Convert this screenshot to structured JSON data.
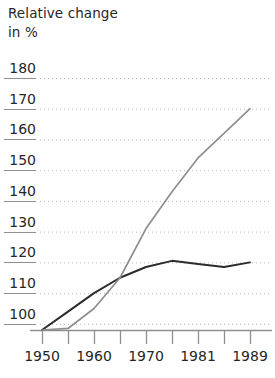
{
  "title": {
    "line1": "Relative change",
    "line2": "in %"
  },
  "colors": {
    "series_dark": "#2c2c2c",
    "series_gray": "#8e8e8e",
    "gridline": "#b9b9b9",
    "axis": "#8f8f8f",
    "text": "#262626"
  },
  "chart_data": {
    "type": "line",
    "title": "Relative change in %",
    "xlabel": "",
    "ylabel": "Relative change in %",
    "ylim": [
      95,
      182
    ],
    "xlim": [
      1950,
      1989
    ],
    "grid": true,
    "legend": "none",
    "yticks": [
      180,
      170,
      160,
      150,
      140,
      130,
      120,
      110,
      100
    ],
    "ytick_labels": [
      "180",
      "170",
      "160",
      "150",
      "140",
      "130",
      "120",
      "110",
      "100"
    ],
    "xticks": [
      1950,
      1955,
      1960,
      1965,
      1970,
      1975,
      1981,
      1985,
      1989
    ],
    "xtick_labels": [
      "1950",
      "",
      "1960",
      "",
      "1970",
      "",
      "1981",
      "",
      "1989"
    ],
    "x": [
      1950,
      1955,
      1960,
      1965,
      1970,
      1975,
      1981,
      1985,
      1989
    ],
    "series": [
      {
        "name": "dark-line",
        "color": "#2c2c2c",
        "values": [
          98,
          104,
          110,
          115,
          118.5,
          120.5,
          119.5,
          118.5,
          120
        ]
      },
      {
        "name": "gray-line",
        "color": "#8e8e8e",
        "values": [
          98,
          98.5,
          105,
          115,
          131,
          143,
          154,
          162,
          170
        ]
      }
    ]
  }
}
